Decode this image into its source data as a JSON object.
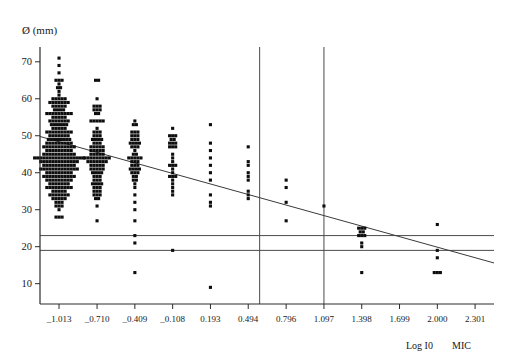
{
  "chart_data": {
    "type": "scatter",
    "title": "",
    "subtitle": "",
    "xlabel": "Log I0  MIC",
    "ylabel": "Ø (mm)",
    "xlabel_parts": [
      "Log I0",
      "MIC"
    ],
    "grid": false,
    "legend": "none",
    "xlim": [
      -1.1645,
      2.4515
    ],
    "ylim": [
      4.5,
      74
    ],
    "x_ticks": [
      -1.013,
      -0.71,
      -0.409,
      -0.108,
      0.193,
      0.494,
      0.796,
      1.097,
      1.398,
      1.699,
      2.0,
      2.301
    ],
    "x_tick_labels": [
      "_1.013",
      "_0.710",
      "_0.409",
      "_0.108",
      "0.193",
      "0.494",
      "0.796",
      "1.097",
      "1.398",
      "1.699",
      "2.000",
      "2.301"
    ],
    "y_ticks": [
      10,
      20,
      30,
      40,
      50,
      60,
      70
    ],
    "y_tick_labels": [
      "10",
      "20",
      "30",
      "40",
      "50",
      "60",
      "70"
    ],
    "reference_lines": {
      "horizontal": [
        {
          "name": "susceptible-breakpoint",
          "y": 23
        },
        {
          "name": "resistant-breakpoint",
          "y": 19
        }
      ],
      "vertical": [
        {
          "name": "mic-breakpoint-low",
          "x": 0.585
        },
        {
          "name": "mic-breakpoint-high",
          "x": 1.097
        }
      ]
    },
    "regression_line": {
      "name": "regression-fit",
      "x1": -1.1645,
      "y1": 49.8,
      "x2": 2.4515,
      "y2": 15.6
    },
    "columns": [
      {
        "x": -1.013,
        "rows": [
          {
            "y": 71,
            "n": 1
          },
          {
            "y": 69,
            "n": 1
          },
          {
            "y": 67,
            "n": 1
          },
          {
            "y": 65,
            "n": 3
          },
          {
            "y": 64,
            "n": 1
          },
          {
            "y": 63,
            "n": 2
          },
          {
            "y": 62,
            "n": 1
          },
          {
            "y": 61,
            "n": 1
          },
          {
            "y": 60,
            "n": 5
          },
          {
            "y": 59,
            "n": 7
          },
          {
            "y": 58,
            "n": 5
          },
          {
            "y": 57,
            "n": 4
          },
          {
            "y": 56,
            "n": 9
          },
          {
            "y": 55,
            "n": 5
          },
          {
            "y": 54,
            "n": 7
          },
          {
            "y": 53,
            "n": 6
          },
          {
            "y": 52,
            "n": 5
          },
          {
            "y": 51,
            "n": 9
          },
          {
            "y": 50,
            "n": 7
          },
          {
            "y": 49,
            "n": 8
          },
          {
            "y": 48,
            "n": 9
          },
          {
            "y": 47,
            "n": 11
          },
          {
            "y": 46,
            "n": 9
          },
          {
            "y": 45,
            "n": 11
          },
          {
            "y": 44,
            "n": 17
          },
          {
            "y": 43,
            "n": 13
          },
          {
            "y": 42,
            "n": 11
          },
          {
            "y": 41,
            "n": 13
          },
          {
            "y": 40,
            "n": 9
          },
          {
            "y": 39,
            "n": 11
          },
          {
            "y": 38,
            "n": 9
          },
          {
            "y": 37,
            "n": 7
          },
          {
            "y": 36,
            "n": 9
          },
          {
            "y": 35,
            "n": 5
          },
          {
            "y": 34,
            "n": 7
          },
          {
            "y": 33,
            "n": 5
          },
          {
            "y": 32,
            "n": 3
          },
          {
            "y": 31,
            "n": 3
          },
          {
            "y": 30,
            "n": 1
          },
          {
            "y": 28,
            "n": 3
          }
        ]
      },
      {
        "x": -0.71,
        "rows": [
          {
            "y": 65,
            "n": 2
          },
          {
            "y": 60,
            "n": 1
          },
          {
            "y": 58,
            "n": 3
          },
          {
            "y": 57,
            "n": 3
          },
          {
            "y": 56,
            "n": 2
          },
          {
            "y": 54,
            "n": 5
          },
          {
            "y": 52,
            "n": 1
          },
          {
            "y": 51,
            "n": 3
          },
          {
            "y": 50,
            "n": 3
          },
          {
            "y": 49,
            "n": 4
          },
          {
            "y": 48,
            "n": 3
          },
          {
            "y": 47,
            "n": 5
          },
          {
            "y": 46,
            "n": 5
          },
          {
            "y": 45,
            "n": 5
          },
          {
            "y": 44,
            "n": 9
          },
          {
            "y": 43,
            "n": 7
          },
          {
            "y": 42,
            "n": 5
          },
          {
            "y": 41,
            "n": 5
          },
          {
            "y": 40,
            "n": 4
          },
          {
            "y": 39,
            "n": 3
          },
          {
            "y": 38,
            "n": 3
          },
          {
            "y": 37,
            "n": 4
          },
          {
            "y": 36,
            "n": 3
          },
          {
            "y": 35,
            "n": 3
          },
          {
            "y": 34,
            "n": 3
          },
          {
            "y": 33,
            "n": 2
          },
          {
            "y": 31,
            "n": 1
          },
          {
            "y": 27,
            "n": 1
          }
        ]
      },
      {
        "x": -0.409,
        "rows": [
          {
            "y": 54,
            "n": 1
          },
          {
            "y": 53,
            "n": 2
          },
          {
            "y": 51,
            "n": 3
          },
          {
            "y": 50,
            "n": 3
          },
          {
            "y": 49,
            "n": 3
          },
          {
            "y": 48,
            "n": 4
          },
          {
            "y": 47,
            "n": 3
          },
          {
            "y": 46,
            "n": 1
          },
          {
            "y": 45,
            "n": 2
          },
          {
            "y": 44,
            "n": 5
          },
          {
            "y": 43,
            "n": 3
          },
          {
            "y": 42,
            "n": 3
          },
          {
            "y": 41,
            "n": 4
          },
          {
            "y": 40,
            "n": 3
          },
          {
            "y": 39,
            "n": 2
          },
          {
            "y": 38,
            "n": 2
          },
          {
            "y": 37,
            "n": 1
          },
          {
            "y": 36,
            "n": 1
          },
          {
            "y": 34,
            "n": 1
          },
          {
            "y": 32,
            "n": 1
          },
          {
            "y": 30,
            "n": 1
          },
          {
            "y": 27,
            "n": 1
          },
          {
            "y": 23,
            "n": 1
          },
          {
            "y": 21,
            "n": 1
          },
          {
            "y": 13,
            "n": 1
          }
        ]
      },
      {
        "x": -0.108,
        "rows": [
          {
            "y": 52,
            "n": 1
          },
          {
            "y": 50,
            "n": 3
          },
          {
            "y": 49,
            "n": 2
          },
          {
            "y": 48,
            "n": 3
          },
          {
            "y": 47,
            "n": 3
          },
          {
            "y": 45,
            "n": 1
          },
          {
            "y": 44,
            "n": 1
          },
          {
            "y": 43,
            "n": 1
          },
          {
            "y": 42,
            "n": 3
          },
          {
            "y": 41,
            "n": 1
          },
          {
            "y": 40,
            "n": 1
          },
          {
            "y": 39,
            "n": 3
          },
          {
            "y": 38,
            "n": 1
          },
          {
            "y": 37,
            "n": 1
          },
          {
            "y": 36,
            "n": 1
          },
          {
            "y": 35,
            "n": 1
          },
          {
            "y": 34,
            "n": 1
          },
          {
            "y": 19,
            "n": 1
          }
        ]
      },
      {
        "x": 0.193,
        "rows": [
          {
            "y": 53,
            "n": 1
          },
          {
            "y": 48,
            "n": 1
          },
          {
            "y": 46,
            "n": 1
          },
          {
            "y": 44,
            "n": 1
          },
          {
            "y": 42,
            "n": 1
          },
          {
            "y": 40,
            "n": 1
          },
          {
            "y": 38,
            "n": 1
          },
          {
            "y": 34,
            "n": 1
          },
          {
            "y": 32,
            "n": 1
          },
          {
            "y": 31,
            "n": 1
          },
          {
            "y": 9,
            "n": 1
          }
        ]
      },
      {
        "x": 0.494,
        "rows": [
          {
            "y": 47,
            "n": 1
          },
          {
            "y": 43,
            "n": 1
          },
          {
            "y": 42,
            "n": 1
          },
          {
            "y": 40,
            "n": 1
          },
          {
            "y": 39,
            "n": 1
          },
          {
            "y": 38,
            "n": 1
          },
          {
            "y": 35,
            "n": 1
          },
          {
            "y": 34,
            "n": 1
          },
          {
            "y": 33,
            "n": 1
          }
        ]
      },
      {
        "x": 0.796,
        "rows": [
          {
            "y": 38,
            "n": 1
          },
          {
            "y": 36,
            "n": 1
          },
          {
            "y": 32,
            "n": 1
          },
          {
            "y": 27,
            "n": 1
          }
        ]
      },
      {
        "x": 1.097,
        "rows": [
          {
            "y": 31,
            "n": 1
          }
        ]
      },
      {
        "x": 1.398,
        "rows": [
          {
            "y": 25,
            "n": 3
          },
          {
            "y": 24,
            "n": 2
          },
          {
            "y": 23,
            "n": 3
          },
          {
            "y": 21,
            "n": 1
          },
          {
            "y": 20,
            "n": 1
          },
          {
            "y": 13,
            "n": 1
          }
        ]
      },
      {
        "x": 2.0,
        "rows": [
          {
            "y": 26,
            "n": 1
          },
          {
            "y": 19,
            "n": 1
          },
          {
            "y": 17,
            "n": 1
          },
          {
            "y": 13,
            "n": 3
          }
        ]
      }
    ]
  }
}
